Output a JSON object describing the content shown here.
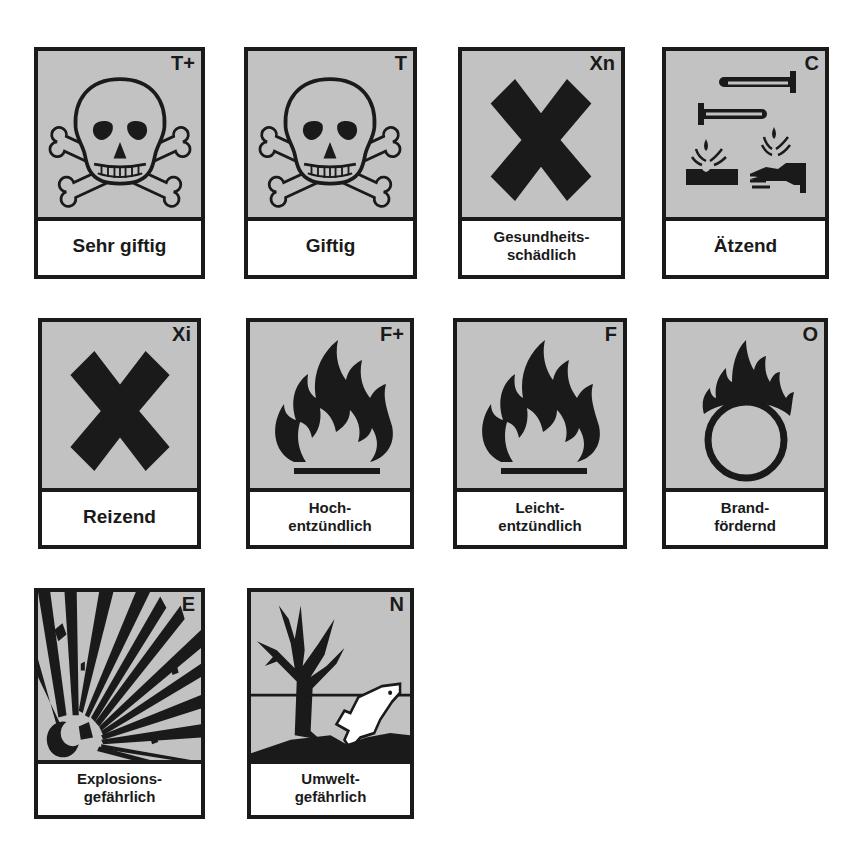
{
  "symbols": [
    {
      "code": "T+",
      "label": "Sehr giftig",
      "icon": "skull-crossbones-icon"
    },
    {
      "code": "T",
      "label": "Giftig",
      "icon": "skull-crossbones-icon"
    },
    {
      "code": "Xn",
      "label_line1": "Gesundheits-",
      "label_line2": "schädlich",
      "icon": "cross-x-icon"
    },
    {
      "code": "C",
      "label": "Ätzend",
      "icon": "corrosive-icon"
    },
    {
      "code": "Xi",
      "label": "Reizend",
      "icon": "cross-x-icon"
    },
    {
      "code": "F+",
      "label_line1": "Hoch-",
      "label_line2": "entzündlich",
      "icon": "flame-icon"
    },
    {
      "code": "F",
      "label_line1": "Leicht-",
      "label_line2": "entzündlich",
      "icon": "flame-icon"
    },
    {
      "code": "O",
      "label_line1": "Brand-",
      "label_line2": "fördernd",
      "icon": "flame-over-circle-icon"
    },
    {
      "code": "E",
      "label_line1": "Explosions-",
      "label_line2": "gefährlich",
      "icon": "exploding-bomb-icon"
    },
    {
      "code": "N",
      "label_line1": "Umwelt-",
      "label_line2": "gefährlich",
      "icon": "dead-tree-fish-icon"
    }
  ],
  "colors": {
    "pictogram_background": "#c2c2c2",
    "ink": "#1a1a1a",
    "label_background": "#ffffff"
  }
}
